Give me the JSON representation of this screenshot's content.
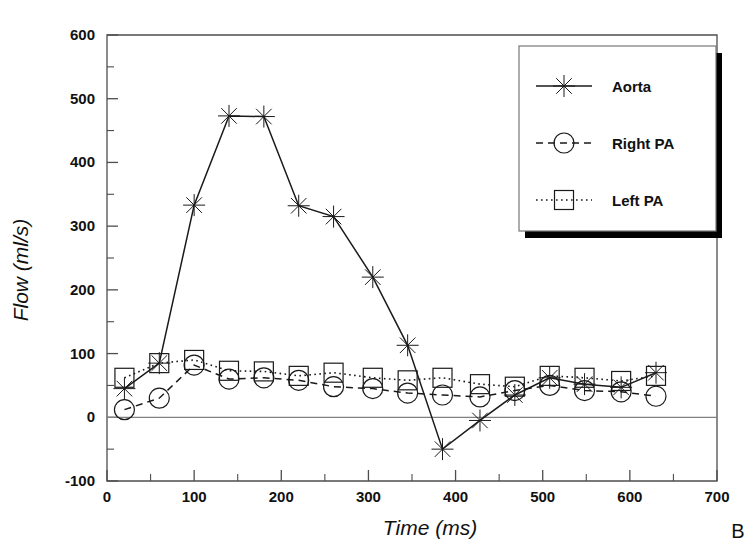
{
  "panel": {
    "label": "B"
  },
  "chart_data": {
    "type": "line",
    "title": "",
    "xlabel": "Time (ms)",
    "ylabel": "Flow (ml/s)",
    "xlim": [
      0,
      700
    ],
    "ylim": [
      -100,
      600
    ],
    "x_ticks": [
      0,
      100,
      200,
      300,
      400,
      500,
      600,
      700
    ],
    "y_ticks": [
      -100,
      0,
      100,
      200,
      300,
      400,
      500,
      600
    ],
    "x_minor_step": 50,
    "y_minor_step": 50,
    "grid": false,
    "legend_position": "top-right",
    "zero_line": 0,
    "series": [
      {
        "name": "Aorta",
        "marker": "asterisk",
        "line_style": "solid",
        "color": "#1a1a1a",
        "x": [
          20,
          60,
          100,
          140,
          180,
          220,
          260,
          305,
          345,
          385,
          428,
          468,
          508,
          548,
          590,
          630
        ],
        "values": [
          45,
          85,
          333,
          473,
          472,
          332,
          315,
          220,
          113,
          -50,
          -5,
          35,
          62,
          52,
          47,
          70
        ]
      },
      {
        "name": "Right PA",
        "marker": "circle",
        "line_style": "dashed",
        "color": "#1a1a1a",
        "x": [
          20,
          60,
          100,
          140,
          180,
          220,
          260,
          305,
          345,
          385,
          428,
          468,
          508,
          548,
          590,
          630
        ],
        "values": [
          12,
          30,
          82,
          60,
          62,
          58,
          48,
          45,
          38,
          35,
          32,
          42,
          50,
          42,
          40,
          33
        ]
      },
      {
        "name": "Left PA",
        "marker": "square",
        "line_style": "dotted",
        "color": "#1a1a1a",
        "x": [
          20,
          60,
          100,
          140,
          180,
          220,
          260,
          305,
          345,
          385,
          428,
          468,
          508,
          548,
          590,
          630
        ],
        "values": [
          62,
          85,
          90,
          73,
          72,
          65,
          70,
          62,
          58,
          62,
          52,
          48,
          65,
          62,
          57,
          65
        ]
      }
    ]
  },
  "legend": {
    "entries": [
      {
        "label": "Aorta"
      },
      {
        "label": "Right PA"
      },
      {
        "label": "Left PA"
      }
    ]
  },
  "colors": {
    "ink": "#1a1a1a",
    "axis": "#4d4d4d",
    "zero_line": "#808080",
    "background": "#ffffff"
  }
}
